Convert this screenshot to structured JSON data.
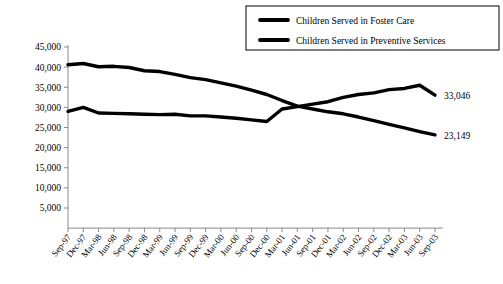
{
  "chart_data": {
    "type": "line",
    "title": "",
    "xlabel": "",
    "ylabel": "",
    "ylim": [
      0,
      45000
    ],
    "yticks": [
      5000,
      10000,
      15000,
      20000,
      25000,
      30000,
      35000,
      40000,
      45000
    ],
    "ytick_labels": [
      "5,000",
      "10,000",
      "15,000",
      "20,000",
      "25,000",
      "30,000",
      "35,000",
      "40,000",
      "45,000"
    ],
    "grid": false,
    "legend_position": "top-right",
    "categories": [
      "Sep-97",
      "Dec-97",
      "Mar-98",
      "Jun-98",
      "Sep-98",
      "Dec-98",
      "Mar-99",
      "Jun-99",
      "Sep-99",
      "Dec-99",
      "Mar-00",
      "Jun-00",
      "Sep-00",
      "Dec-00",
      "Mar-01",
      "Jun-01",
      "Sep-01",
      "Dec-01",
      "Mar-02",
      "Jun-02",
      "Sep-02",
      "Dec-02",
      "Mar-03",
      "Jun-03",
      "Sep-03"
    ],
    "series": [
      {
        "name": "Children Served in Foster Care",
        "color": "#000000",
        "end_label": "23,149",
        "values": [
          40600,
          40900,
          40100,
          40200,
          39900,
          39100,
          38900,
          38200,
          37400,
          36900,
          36100,
          35300,
          34300,
          33200,
          31700,
          30300,
          29600,
          28900,
          28400,
          27600,
          26700,
          25800,
          24900,
          24000,
          23149
        ]
      },
      {
        "name": "Children Served in Preventive Services",
        "color": "#000000",
        "end_label": "33,046",
        "values": [
          29000,
          30000,
          28600,
          28500,
          28400,
          28300,
          28200,
          28300,
          27900,
          27900,
          27600,
          27300,
          26900,
          26500,
          29600,
          30200,
          30800,
          31400,
          32500,
          33200,
          33600,
          34400,
          34700,
          35500,
          33046
        ]
      }
    ]
  },
  "legend": {
    "items": [
      {
        "label": "Children Served in Foster Care"
      },
      {
        "label": "Children Served in Preventive Services"
      }
    ]
  }
}
